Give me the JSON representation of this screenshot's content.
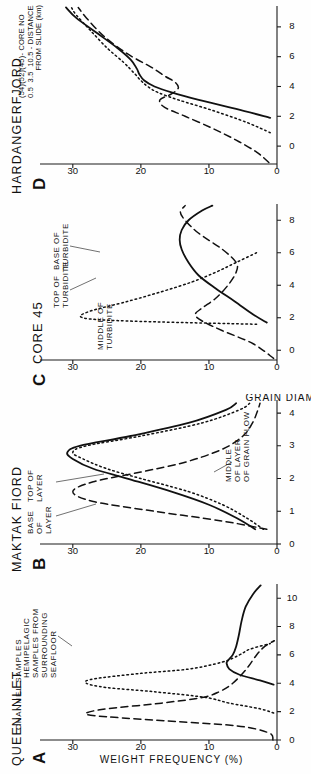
{
  "figure": {
    "y_axis_title": "WEIGHT FREQUENCY (%)",
    "x_axis_title": "GRAIN DIAMETER (ϕ)",
    "y_ticks": [
      "0",
      "10",
      "20",
      "30"
    ]
  },
  "panels": [
    {
      "letter": "A",
      "title": "QUEEN INLET",
      "subtitle": "CHANNEL SAMPLES",
      "x_ticks": [
        "0",
        "2",
        "4",
        "6",
        "8",
        "10"
      ],
      "annotations": [
        {
          "name": "hemipelagic",
          "text": "HEMIPELAGIC\nSAMPLES FROM\nSURROUNDING\nSEAFLOOR"
        }
      ]
    },
    {
      "letter": "B",
      "title": "MAKTAK FIORD",
      "subtitle": "",
      "x_ticks": [
        "0",
        "1",
        "2",
        "3",
        "4"
      ],
      "annotations": [
        {
          "name": "base-of-layer",
          "text": "BASE\nOF\nLAYER"
        },
        {
          "name": "top-of-layer",
          "text": "TOP OF\nLAYER"
        },
        {
          "name": "middle-of-layer",
          "text": "MIDDLE\nOF LAYER\nOF GRAIN FLOW"
        }
      ]
    },
    {
      "letter": "C",
      "title": "",
      "subtitle": "CORE 45",
      "x_ticks": [
        "0",
        "2",
        "4",
        "6",
        "8"
      ],
      "annotations": [
        {
          "name": "middle-of-turbidite",
          "text": "MIDDLE OF\nTURBIDITE"
        },
        {
          "name": "top-of-turbidite",
          "text": "TOP OF\nTURBIDITE"
        },
        {
          "name": "base-of-turbidite",
          "text": "BASE OF\nTURBIDITE"
        }
      ]
    },
    {
      "letter": "D",
      "title": "HARDANGERFJORD",
      "subtitle": "",
      "x_ticks": [
        "0",
        "2",
        "4",
        "6",
        "8"
      ],
      "legend": "(54)(52)(45)- CORE NO\n0.5  3.5  10.5 - DISTANCE\n            FROM SLIDE (km)",
      "annotations": []
    }
  ],
  "chart_data": {
    "type": "line",
    "xlabel": "GRAIN DIAMETER (ϕ)",
    "ylabel": "WEIGHT FREQUENCY (%)",
    "ylim": [
      0,
      31
    ],
    "grid": false,
    "legend_position": "inline-annotations",
    "panels": [
      {
        "panel": "A",
        "title": "QUEEN INLET",
        "subtitle": "CHANNEL SAMPLES",
        "xlim": [
          0,
          11
        ],
        "xticks": [
          0,
          2,
          4,
          6,
          8,
          10
        ],
        "series": [
          {
            "name": "channel sample 1",
            "style": "dashed",
            "x": [
              0.0,
              0.5,
              1.0,
              1.4,
              1.7,
              1.9,
              2.2,
              2.6,
              3.0,
              3.4,
              4.0,
              5.0,
              6.0,
              6.6,
              7.0
            ],
            "values": [
              0.6,
              1.2,
              6.0,
              18.0,
              26.5,
              28.0,
              25.0,
              17.0,
              11.0,
              8.5,
              6.5,
              4.5,
              3.0,
              1.8,
              0.4
            ]
          },
          {
            "name": "channel sample 2",
            "style": "dotted",
            "x": [
              1.9,
              2.2,
              2.6,
              3.0,
              3.4,
              3.7,
              4.0,
              4.3,
              4.7,
              5.0,
              5.5,
              6.0,
              6.4,
              6.8
            ],
            "values": [
              0.5,
              2.5,
              7.0,
              10.5,
              18.0,
              25.0,
              28.0,
              27.0,
              20.0,
              13.0,
              8.0,
              5.5,
              4.0,
              1.0
            ]
          },
          {
            "name": "hemipelagic samples from surrounding seafloor",
            "style": "solid",
            "x": [
              3.9,
              4.2,
              4.6,
              5.0,
              5.4,
              5.6,
              6.0,
              6.6,
              7.4,
              8.4,
              9.4,
              10.3,
              10.9
            ],
            "values": [
              0.5,
              2.5,
              5.5,
              7.0,
              7.4,
              7.2,
              6.5,
              6.0,
              5.6,
              5.2,
              4.6,
              3.5,
              2.4
            ]
          }
        ]
      },
      {
        "panel": "B",
        "title": "MAKTAK FIORD",
        "xlim": [
          0,
          4.4
        ],
        "xticks": [
          0,
          1,
          2,
          3,
          4
        ],
        "series": [
          {
            "name": "middle of layer of grain flow",
            "style": "dashed",
            "x": [
              0.45,
              0.7,
              1.0,
              1.3,
              1.6,
              1.9,
              2.2,
              2.5,
              2.9,
              3.3,
              3.7,
              4.1,
              4.3
            ],
            "values": [
              1.5,
              8.0,
              18.0,
              27.0,
              30.0,
              27.0,
              20.0,
              13.5,
              8.0,
              5.0,
              3.6,
              2.8,
              2.5
            ]
          },
          {
            "name": "top of layer",
            "style": "dotted",
            "x": [
              0.45,
              0.8,
              1.2,
              1.6,
              2.0,
              2.3,
              2.6,
              2.8,
              3.0,
              3.3,
              3.7,
              4.1,
              4.3
            ],
            "values": [
              2.0,
              4.5,
              8.0,
              13.0,
              20.0,
              25.0,
              28.5,
              30.0,
              28.0,
              20.0,
              11.0,
              5.5,
              4.0
            ]
          },
          {
            "name": "base of layer",
            "style": "solid",
            "x": [
              0.45,
              0.8,
              1.2,
              1.6,
              2.0,
              2.3,
              2.6,
              2.8,
              3.0,
              3.3,
              3.7,
              4.1,
              4.3
            ],
            "values": [
              3.2,
              6.0,
              10.0,
              15.5,
              22.0,
              27.0,
              30.0,
              30.8,
              29.0,
              21.5,
              13.0,
              7.5,
              6.0
            ]
          }
        ]
      },
      {
        "panel": "C",
        "subtitle": "CORE 45",
        "xlim": [
          -0.6,
          9
        ],
        "xticks": [
          0,
          2,
          4,
          6,
          8
        ],
        "series": [
          {
            "name": "middle of turbidite",
            "style": "dotted",
            "x": [
              1.6,
              1.8,
              2.0,
              2.4,
              3.0,
              3.6,
              4.2,
              4.8,
              5.4,
              6.0
            ],
            "values": [
              3.0,
              22.0,
              28.5,
              27.5,
              22.0,
              17.0,
              12.5,
              9.0,
              6.0,
              3.0
            ]
          },
          {
            "name": "base of turbidite",
            "style": "dashed",
            "x": [
              -0.5,
              0.4,
              1.2,
              1.8,
              2.2,
              2.6,
              3.2,
              4.0,
              4.8,
              5.4,
              6.2,
              7.2,
              8.0,
              8.5,
              8.9
            ],
            "values": [
              0.5,
              3.5,
              8.0,
              11.0,
              12.0,
              11.0,
              9.0,
              7.2,
              6.0,
              6.0,
              8.0,
              11.5,
              13.5,
              14.2,
              13.5
            ]
          },
          {
            "name": "top of turbidite",
            "style": "solid",
            "x": [
              1.7,
              2.2,
              3.0,
              3.8,
              4.6,
              5.4,
              6.2,
              6.8,
              7.4,
              8.0,
              8.6,
              8.9
            ],
            "values": [
              1.5,
              3.5,
              6.2,
              9.0,
              11.5,
              13.0,
              14.0,
              14.3,
              14.0,
              13.0,
              11.0,
              9.5
            ]
          }
        ]
      },
      {
        "panel": "D",
        "title": "HARDANGERFJORD",
        "xlim": [
          -1.2,
          9.4
        ],
        "xticks": [
          0,
          2,
          4,
          6,
          8
        ],
        "series": [
          {
            "name": "core 45 - 10.5 km from slide",
            "style": "dashed",
            "x": [
              -1.1,
              -0.4,
              0.4,
              1.2,
              2.0,
              2.6,
              3.1,
              3.5,
              3.9,
              4.3,
              4.7,
              5.3,
              6.2,
              7.4,
              8.6,
              9.3
            ],
            "values": [
              1.2,
              3.0,
              6.0,
              9.5,
              13.5,
              16.5,
              17.2,
              15.5,
              14.5,
              15.0,
              16.5,
              18.5,
              22.0,
              25.5,
              28.0,
              29.2
            ]
          },
          {
            "name": "core 52 - 3.5 km from slide",
            "style": "dotted",
            "x": [
              0.9,
              1.6,
              2.4,
              3.1,
              3.6,
              4.0,
              4.4,
              4.9,
              5.6,
              6.6,
              7.8,
              8.8,
              9.3
            ],
            "values": [
              1.0,
              4.5,
              9.5,
              14.5,
              17.5,
              19.0,
              20.0,
              21.0,
              22.5,
              25.0,
              27.5,
              29.5,
              30.2
            ]
          },
          {
            "name": "core 54 - 0.5 km from slide",
            "style": "solid",
            "x": [
              1.9,
              2.5,
              3.1,
              3.6,
              4.0,
              4.4,
              4.8,
              5.2,
              5.8,
              6.6,
              7.6,
              8.6,
              9.3
            ],
            "values": [
              1.0,
              6.0,
              11.5,
              15.5,
              18.0,
              19.5,
              20.2,
              20.6,
              21.5,
              23.5,
              26.5,
              29.5,
              31.0
            ]
          }
        ]
      }
    ]
  }
}
